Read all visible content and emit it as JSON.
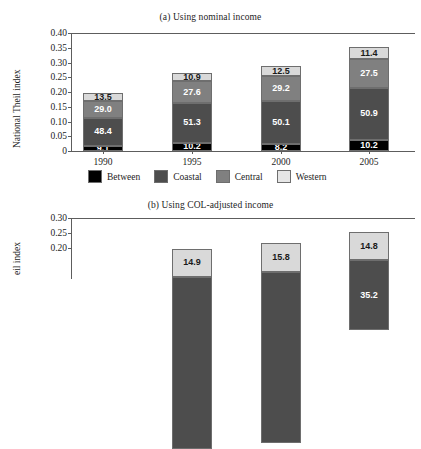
{
  "figure": {
    "axis_color": "#5d5d5d",
    "text_color": "#1d1d1d"
  },
  "legend": {
    "items": [
      {
        "label": "Between",
        "color": "#000000"
      },
      {
        "label": "Coastal",
        "color": "#4d4d4d"
      },
      {
        "label": "Central",
        "color": "#808080"
      },
      {
        "label": "Western",
        "color": "#d9d9d9"
      }
    ]
  },
  "chart_data": [
    {
      "type": "bar",
      "subtype": "stacked-bar",
      "title": "(a) Using nominal income",
      "xlabel": "",
      "ylabel": "National Theil index",
      "categories": [
        "1990",
        "1995",
        "2000",
        "2005"
      ],
      "ylim": [
        0,
        0.4
      ],
      "yticks": [
        "0",
        "0.05",
        "0.10",
        "0.15",
        "0.20",
        "0.25",
        "0.30",
        "0.35",
        "0.40"
      ],
      "ytick_values": [
        0,
        0.05,
        0.1,
        0.15,
        0.2,
        0.25,
        0.3,
        0.35,
        0.4
      ],
      "grid": false,
      "legend_position": "below",
      "totals": [
        0.195,
        0.265,
        0.289,
        0.352
      ],
      "series": [
        {
          "name": "Between",
          "color": "#000000",
          "label_color": "#ffffff",
          "values": [
            9.1,
            10.2,
            8.2,
            10.2
          ],
          "labels": [
            "9.1",
            "10.2",
            "8.2",
            "10.2"
          ]
        },
        {
          "name": "Coastal",
          "color": "#4d4d4d",
          "label_color": "#ffffff",
          "values": [
            48.4,
            51.3,
            50.1,
            50.9
          ],
          "labels": [
            "48.4",
            "51.3",
            "50.1",
            "50.9"
          ]
        },
        {
          "name": "Central",
          "color": "#808080",
          "label_color": "#ffffff",
          "values": [
            29.0,
            27.6,
            29.2,
            27.5
          ],
          "labels": [
            "29.0",
            "27.6",
            "29.2",
            "27.5"
          ]
        },
        {
          "name": "Western",
          "color": "#d9d9d9",
          "label_color": "#1a1a1a",
          "values": [
            13.5,
            10.9,
            12.5,
            11.4
          ],
          "labels": [
            "13.5",
            "10.9",
            "12.5",
            "11.4"
          ]
        }
      ],
      "units": "percent share of stacked total"
    },
    {
      "type": "bar",
      "subtype": "stacked-bar",
      "title": "(b) Using COL-adjusted income",
      "xlabel": "",
      "ylabel": "eil index",
      "ylabel_full": "National Theil index",
      "categories": [
        "1990",
        "1995",
        "2000",
        "2005"
      ],
      "ylim": [
        0,
        0.3
      ],
      "yticks": [
        "0.20",
        "0.25",
        "0.30"
      ],
      "ytick_values": [
        0.2,
        0.25,
        0.3
      ],
      "grid": false,
      "cropped": "true",
      "totals": [
        null,
        0.196,
        0.216,
        0.252
      ],
      "series": [
        {
          "name": "Coastal",
          "color": "#4d4d4d",
          "label_color": "#ffffff",
          "values": [
            null,
            null,
            null,
            35.2
          ],
          "labels": [
            "",
            "",
            "",
            "35.2"
          ]
        },
        {
          "name": "Western",
          "color": "#d9d9d9",
          "label_color": "#1a1a1a",
          "values": [
            null,
            14.9,
            15.8,
            14.8
          ],
          "labels": [
            "",
            "14.9",
            "15.8",
            "14.8"
          ]
        }
      ]
    }
  ]
}
